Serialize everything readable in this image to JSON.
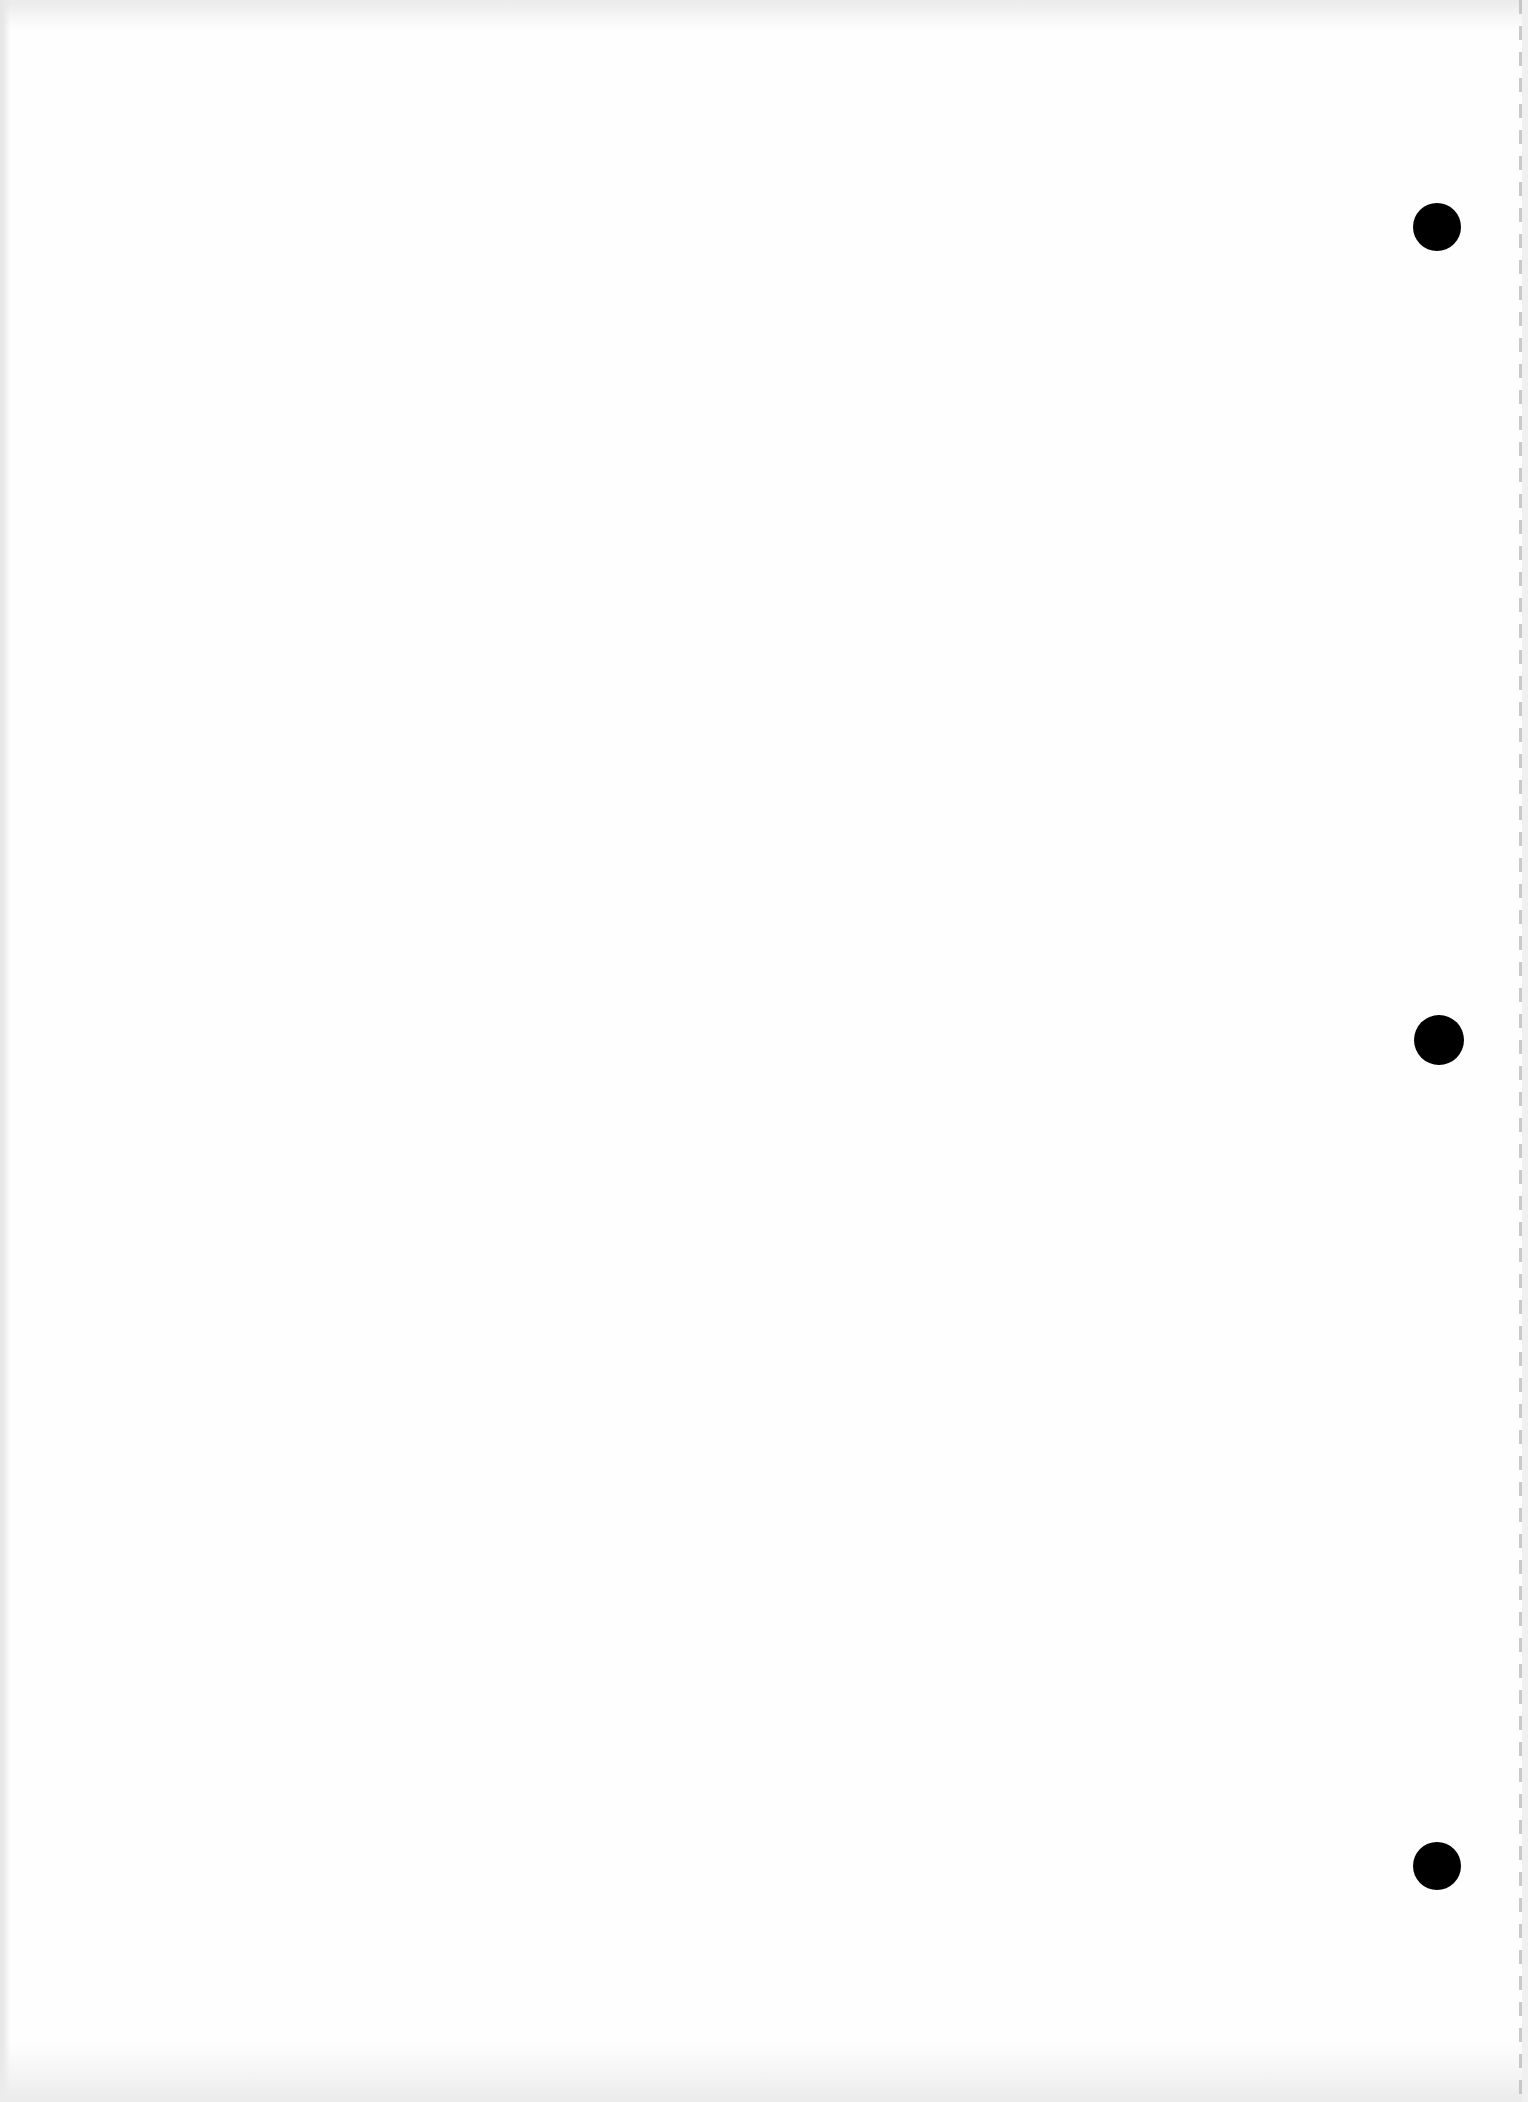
{
  "document": {
    "type": "blank scanned page",
    "text": "",
    "background_color": "#fefefe",
    "hole_color": "#000000",
    "punch_holes": [
      {
        "position": "top",
        "cx": 1437,
        "cy": 227,
        "r": 24
      },
      {
        "position": "middle",
        "cx": 1439,
        "cy": 1040,
        "r": 25
      },
      {
        "position": "bottom",
        "cx": 1437,
        "cy": 1866,
        "r": 24
      }
    ]
  }
}
